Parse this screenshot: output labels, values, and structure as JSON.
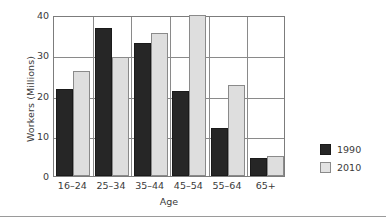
{
  "chart_data": {
    "type": "bar",
    "title": "",
    "xlabel": "Age",
    "ylabel": "Workers (Millions)",
    "categories": [
      "16–24",
      "25–34",
      "35–44",
      "45–54",
      "55–64",
      "65+"
    ],
    "series": [
      {
        "name": "1990",
        "color": "#262626",
        "values": [
          21.5,
          36.8,
          33.0,
          21.0,
          12.0,
          4.5
        ]
      },
      {
        "name": "2010",
        "color": "#dedede",
        "values": [
          26.0,
          29.5,
          35.6,
          40.0,
          22.5,
          5.0
        ]
      }
    ],
    "ylim": [
      0,
      40
    ],
    "yticks": [
      "0",
      "10",
      "20",
      "30",
      "40"
    ],
    "ytick_values": [
      0,
      10,
      20,
      30,
      40
    ],
    "grid": "horizontal-and-group-separators",
    "legend_position": "right"
  },
  "legend": {
    "entries": [
      {
        "label": "1990",
        "swatch": "dark-square-swatch"
      },
      {
        "label": "2010",
        "swatch": "light-square-swatch"
      }
    ]
  },
  "colors": {
    "series_1990": "#262626",
    "series_2010": "#dedede",
    "axis": "#7c7c7c",
    "gridline": "#8a8a8a",
    "text": "#3a3a3a",
    "background": "#ffffff"
  }
}
